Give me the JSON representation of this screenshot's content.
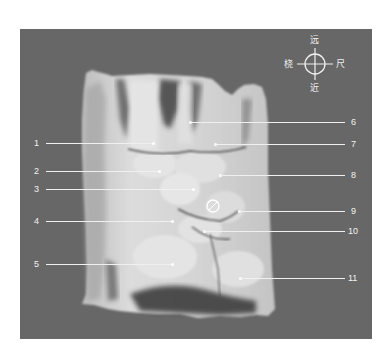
{
  "figure": {
    "background_color": "#676767",
    "page_background": "#ffffff",
    "orientation_indicator": {
      "top": "远",
      "bottom": "近",
      "left": "桡",
      "right": "尺"
    },
    "labels": [
      {
        "number": "1",
        "side": "left",
        "y": 143
      },
      {
        "number": "2",
        "side": "left",
        "y": 171
      },
      {
        "number": "3",
        "side": "left",
        "y": 189
      },
      {
        "number": "4",
        "side": "left",
        "y": 221
      },
      {
        "number": "5",
        "side": "left",
        "y": 264
      },
      {
        "number": "6",
        "side": "right",
        "y": 122
      },
      {
        "number": "7",
        "side": "right",
        "y": 144
      },
      {
        "number": "8",
        "side": "right",
        "y": 175
      },
      {
        "number": "9",
        "side": "right",
        "y": 211
      },
      {
        "number": "10",
        "side": "right",
        "y": 231
      },
      {
        "number": "11",
        "side": "right",
        "y": 278
      }
    ]
  }
}
